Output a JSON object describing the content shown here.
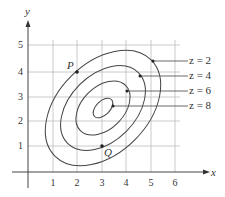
{
  "diagram": {
    "type": "contour-map",
    "x_axis": {
      "label": "x",
      "ticks": [
        "1",
        "2",
        "3",
        "4",
        "5",
        "6"
      ]
    },
    "y_axis": {
      "label": "y",
      "ticks": [
        "1",
        "2",
        "3",
        "4",
        "5"
      ]
    },
    "points": [
      {
        "name": "P",
        "x": 2,
        "y": 4
      },
      {
        "name": "Q",
        "x": 3,
        "y": 1
      }
    ],
    "contours": [
      {
        "label": "z = 2",
        "value": 2
      },
      {
        "label": "z = 4",
        "value": 4
      },
      {
        "label": "z = 6",
        "value": 6
      },
      {
        "label": "z = 8",
        "value": 8
      }
    ],
    "colors": {
      "line": "#444444",
      "grid": "#bbbbbb"
    }
  }
}
